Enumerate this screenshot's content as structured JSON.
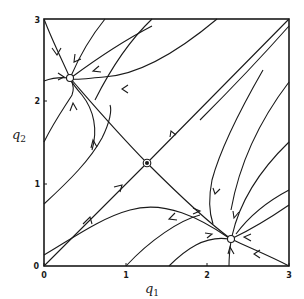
{
  "figure": {
    "type": "phase-portrait",
    "x_axis": {
      "label": "q",
      "label_sub": "1",
      "ticks": [
        "0",
        "1",
        "2",
        "3"
      ],
      "range": [
        0,
        3
      ]
    },
    "y_axis": {
      "label": "q",
      "label_sub": "2",
      "ticks": [
        "0",
        "1",
        "2",
        "3"
      ],
      "range": [
        0,
        3
      ]
    },
    "fixed_points": [
      {
        "name": "stable-node-upper-left",
        "q1": 0.32,
        "q2": 2.28,
        "kind": "stable node"
      },
      {
        "name": "saddle-center",
        "q1": 1.26,
        "q2": 1.25,
        "kind": "saddle"
      },
      {
        "name": "stable-node-lower-right",
        "q1": 2.29,
        "q2": 0.33,
        "kind": "stable node"
      }
    ],
    "colors": {
      "ink": "#1a1a1a",
      "background": "#ffffff"
    }
  }
}
